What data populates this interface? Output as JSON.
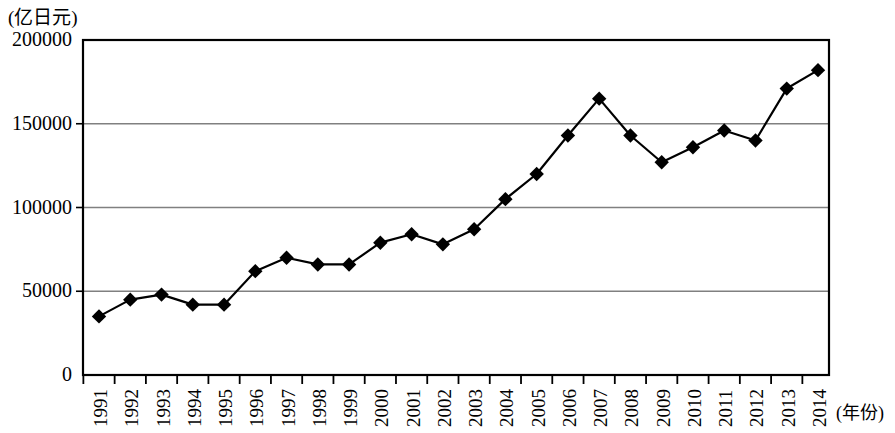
{
  "chart_data": {
    "type": "line",
    "title": "",
    "subtitle": "",
    "ylabel": "(亿日元)",
    "xlabel": "(年份)",
    "grid": true,
    "legend": null,
    "ylim": [
      0,
      200000
    ],
    "yticks": [
      0,
      50000,
      100000,
      150000,
      200000
    ],
    "ytick_labels": [
      "0",
      "50000",
      "100000",
      "150000",
      "200000"
    ],
    "categories": [
      "1991",
      "1992",
      "1993",
      "1994",
      "1995",
      "1996",
      "1997",
      "1998",
      "1999",
      "2000",
      "2001",
      "2002",
      "2003",
      "2004",
      "2005",
      "2006",
      "2007",
      "2008",
      "2009",
      "2010",
      "2011",
      "2012",
      "2013",
      "2014"
    ],
    "values": [
      35000,
      45000,
      48000,
      42000,
      42000,
      62000,
      70000,
      66000,
      66000,
      79000,
      84000,
      78000,
      87000,
      105000,
      120000,
      143000,
      165000,
      143000,
      127000,
      136000,
      146000,
      140000,
      171000,
      182000
    ],
    "series": [
      {
        "name": "",
        "marker": "diamond",
        "color": "#000000",
        "values": [
          35000,
          45000,
          48000,
          42000,
          42000,
          62000,
          70000,
          66000,
          66000,
          79000,
          84000,
          78000,
          87000,
          105000,
          120000,
          143000,
          165000,
          143000,
          127000,
          136000,
          146000,
          140000,
          171000,
          182000
        ]
      }
    ]
  },
  "style": {
    "line_color": "#000000",
    "marker_color": "#000000",
    "grid_color": "#808080",
    "frame_color": "#000000",
    "background": "#ffffff"
  }
}
